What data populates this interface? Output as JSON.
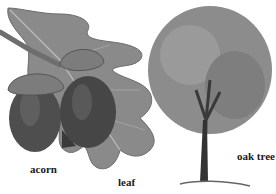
{
  "labels": {
    "acorn": "acorn",
    "leaf": "leaf",
    "oak_tree": "oak tree"
  },
  "colors": {
    "leaf": "#8a8a8a",
    "leaf_dark": "#5e5e5e",
    "acorn_body": "#4a4a4a",
    "acorn_cap": "#7a7a7a",
    "tree_canopy": "#8c8c8c",
    "trunk": "#3a3a3a"
  }
}
